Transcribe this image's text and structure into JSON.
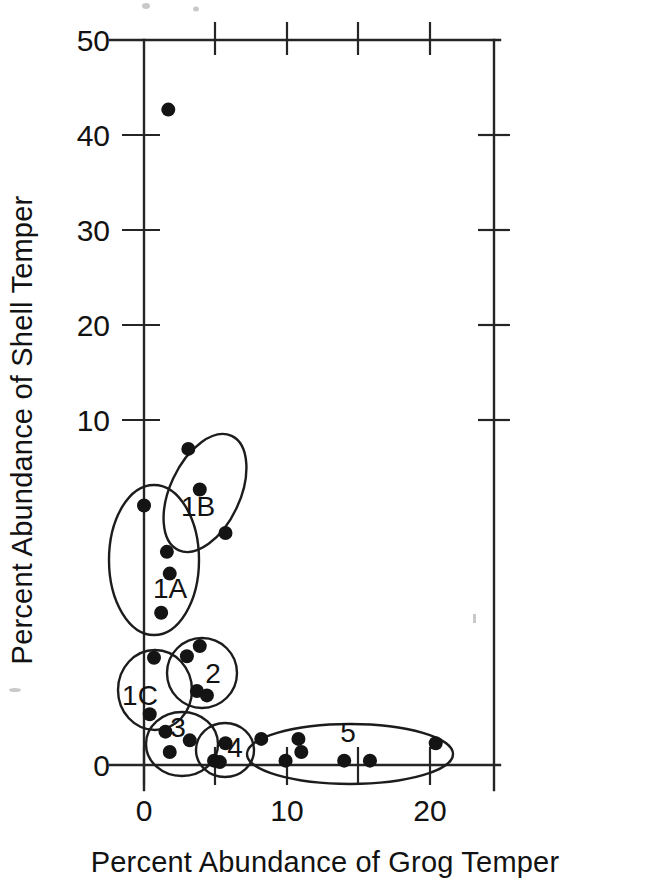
{
  "chart_data": {
    "type": "scatter",
    "title": "",
    "xlabel": "Percent Abundance of Grog Temper",
    "ylabel": "Percent Abundance of Shell Temper",
    "xlim": [
      -1.5,
      24.5
    ],
    "ylim": [
      -1.5,
      50
    ],
    "xticks": [
      0,
      5,
      10,
      15,
      20,
      25
    ],
    "xtick_labels": [
      "0",
      "",
      "10",
      "",
      "20",
      ""
    ],
    "yticks": [
      0,
      10,
      20,
      30,
      40,
      50
    ],
    "ytick_labels": [
      "0",
      "10",
      "20",
      "30",
      "40",
      "50"
    ],
    "grid": false,
    "legend": "none",
    "frame": "box",
    "marker": "filled-circle",
    "marker_color": "#141414",
    "points": [
      {
        "x": 1.7,
        "y": 45.2,
        "cluster": ""
      },
      {
        "x": 0.0,
        "y": 17.9,
        "cluster": "1A"
      },
      {
        "x": 1.6,
        "y": 14.7,
        "cluster": "1A"
      },
      {
        "x": 1.8,
        "y": 13.2,
        "cluster": "1A"
      },
      {
        "x": 1.2,
        "y": 10.5,
        "cluster": "1A"
      },
      {
        "x": 3.1,
        "y": 21.8,
        "cluster": "1B"
      },
      {
        "x": 3.9,
        "y": 19.0,
        "cluster": "1B"
      },
      {
        "x": 5.7,
        "y": 16.0,
        "cluster": "1B"
      },
      {
        "x": 0.7,
        "y": 7.4,
        "cluster": "1C"
      },
      {
        "x": 0.4,
        "y": 3.5,
        "cluster": "1C"
      },
      {
        "x": 3.9,
        "y": 8.2,
        "cluster": "2"
      },
      {
        "x": 3.0,
        "y": 7.5,
        "cluster": "2"
      },
      {
        "x": 3.7,
        "y": 5.1,
        "cluster": "2"
      },
      {
        "x": 4.4,
        "y": 4.8,
        "cluster": "2"
      },
      {
        "x": 1.5,
        "y": 2.3,
        "cluster": "3"
      },
      {
        "x": 3.2,
        "y": 1.7,
        "cluster": "3"
      },
      {
        "x": 1.8,
        "y": 0.9,
        "cluster": "3"
      },
      {
        "x": 5.7,
        "y": 1.5,
        "cluster": "4"
      },
      {
        "x": 4.9,
        "y": 0.3,
        "cluster": "4"
      },
      {
        "x": 5.3,
        "y": 0.2,
        "cluster": "4"
      },
      {
        "x": 8.2,
        "y": 1.8,
        "cluster": "5"
      },
      {
        "x": 9.9,
        "y": 0.3,
        "cluster": "5"
      },
      {
        "x": 10.8,
        "y": 1.8,
        "cluster": "5"
      },
      {
        "x": 11.0,
        "y": 0.9,
        "cluster": "5"
      },
      {
        "x": 14.0,
        "y": 0.3,
        "cluster": "5"
      },
      {
        "x": 15.8,
        "y": 0.3,
        "cluster": "5"
      },
      {
        "x": 20.4,
        "y": 1.5,
        "cluster": "5"
      }
    ],
    "clusters": [
      {
        "label": "1A",
        "cx": 154,
        "cy": 560,
        "rx": 45,
        "ry": 75,
        "rotation": 0,
        "label_x": 170,
        "label_y": 598
      },
      {
        "label": "1B",
        "cx": 205,
        "cy": 493,
        "rx": 35,
        "ry": 63,
        "rotation": 25,
        "label_x": 198,
        "label_y": 516
      },
      {
        "label": "1C",
        "cx": 155,
        "cy": 690,
        "rx": 37,
        "ry": 40,
        "rotation": 0,
        "label_x": 140,
        "label_y": 705
      },
      {
        "label": "2",
        "cx": 202,
        "cy": 673,
        "rx": 35,
        "ry": 35,
        "rotation": 0,
        "label_x": 213,
        "label_y": 683
      },
      {
        "label": "3",
        "cx": 182,
        "cy": 744,
        "rx": 36,
        "ry": 32,
        "rotation": 0,
        "label_x": 178,
        "label_y": 737
      },
      {
        "label": "4",
        "cx": 225,
        "cy": 750,
        "rx": 29,
        "ry": 27,
        "rotation": 0,
        "label_x": 235,
        "label_y": 757
      },
      {
        "label": "5",
        "cx": 350,
        "cy": 754,
        "rx": 103,
        "ry": 30,
        "rotation": 0,
        "label_x": 348,
        "label_y": 742
      }
    ]
  },
  "axes": {
    "x_label": "Percent Abundance of Grog Temper",
    "y_label": "Percent Abundance of Shell Temper",
    "x_tick_labels": [
      "0",
      "10",
      "20"
    ],
    "y_tick_labels": [
      "0",
      "10",
      "20",
      "30",
      "40",
      "50"
    ]
  },
  "cluster_labels": {
    "c1a": "1A",
    "c1b": "1B",
    "c1c": "1C",
    "c2": "2",
    "c3": "3",
    "c4": "4",
    "c5": "5"
  }
}
